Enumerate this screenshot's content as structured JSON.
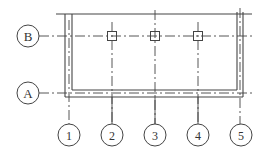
{
  "diagram": {
    "type": "structural-grid-plan",
    "row_axes": [
      {
        "label": "B"
      },
      {
        "label": "A"
      }
    ],
    "column_axes": [
      {
        "label": "1"
      },
      {
        "label": "2"
      },
      {
        "label": "3"
      },
      {
        "label": "4"
      },
      {
        "label": "5"
      }
    ],
    "columns_on_axis_B": [
      "2",
      "3",
      "4"
    ],
    "line_color": "#444444",
    "background": "#ffffff"
  }
}
